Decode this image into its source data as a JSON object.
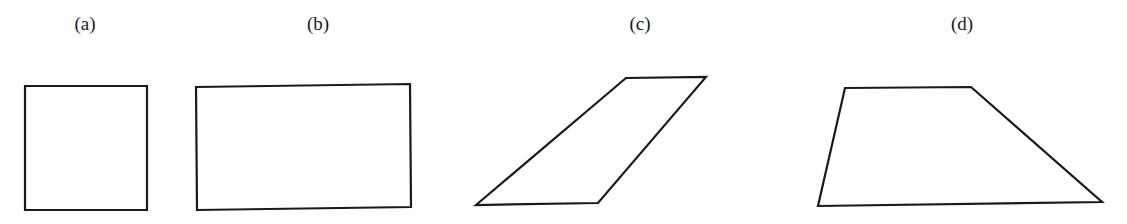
{
  "figures": [
    {
      "label": "(a)",
      "shape": "square",
      "label_x": 85,
      "points": "25,86 147,86 147,210 25,210"
    },
    {
      "label": "(b)",
      "shape": "rectangle",
      "label_x": 318,
      "points": "196,87 410,84 411,207 197,210"
    },
    {
      "label": "(c)",
      "shape": "parallelogram",
      "label_x": 640,
      "points": "626,78 706,77 598,203 476,205"
    },
    {
      "label": "(d)",
      "shape": "trapezium",
      "label_x": 962,
      "points": "845,88 971,87 1102,202 818,206"
    }
  ],
  "colors": {
    "stroke": "#1a1a1a",
    "background": "#ffffff"
  }
}
